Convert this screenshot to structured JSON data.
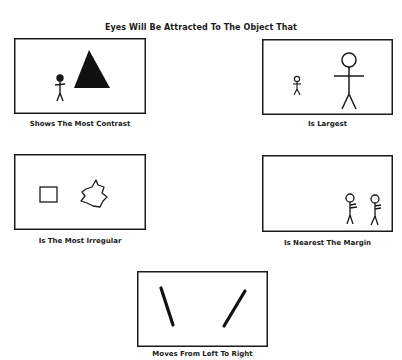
{
  "title": "Eyes Will Be Attracted To The Object That",
  "panels": [
    {
      "id": "contrast",
      "caption": "Shows The Most Contrast",
      "icons": [
        "stick-figure-icon",
        "filled-triangle-icon"
      ]
    },
    {
      "id": "largest",
      "caption": "Is Largest",
      "icons": [
        "small-stick-figure-icon",
        "large-stick-figure-icon"
      ]
    },
    {
      "id": "irregular",
      "caption": "Is The Most Irregular",
      "icons": [
        "square-icon",
        "irregular-blob-icon"
      ]
    },
    {
      "id": "margin",
      "caption": "Is Nearest The Margin",
      "icons": [
        "stick-figure-icon",
        "stick-figure-icon"
      ]
    },
    {
      "id": "movement",
      "caption": "Moves From Left To Right",
      "icons": [
        "backslash-stroke-icon",
        "forward-slash-stroke-icon"
      ]
    }
  ],
  "colors": {
    "ink": "#1a1a1a",
    "background": "#ffffff"
  }
}
